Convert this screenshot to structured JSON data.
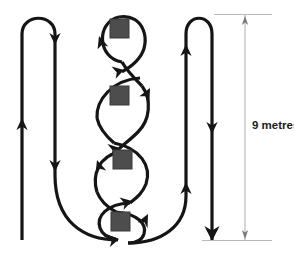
{
  "diagram": {
    "background_color": "#ffffff",
    "path_color": "#151515",
    "marker_color": "#4d4d4d",
    "dimension_color": "#b9b9b9",
    "dimension": {
      "label": "9 metres",
      "value": 9,
      "unit": "metres",
      "orientation": "vertical",
      "top_arrow": "up-arrow",
      "bottom_arrow": "down-arrow"
    },
    "loops": [
      {
        "name": "loop-1",
        "marker": "square"
      },
      {
        "name": "loop-2",
        "marker": "square"
      },
      {
        "name": "loop-3",
        "marker": "square"
      },
      {
        "name": "loop-4",
        "marker": "square"
      }
    ],
    "markers_count": 4,
    "direction_arrows": [
      "left-lane-up-arrow",
      "left-hairpin-down-arrow",
      "inner-left-down-arrow",
      "right-lane-up-arrow",
      "right-hairpin-down-arrow",
      "loop-arrows"
    ]
  }
}
